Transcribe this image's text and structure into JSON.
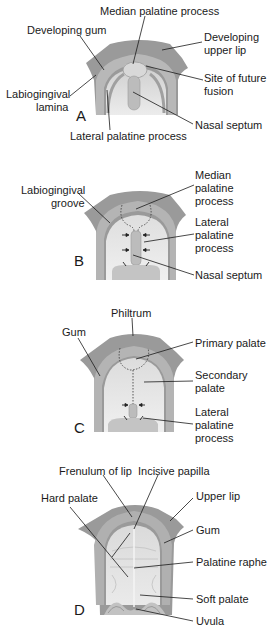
{
  "colors": {
    "tissue_dark": "#8f8f8f",
    "tissue_mid": "#ababab",
    "tissue_light": "#d6d6d6",
    "palate_light": "#e6e6e6",
    "leader_line": "#1a1a1a",
    "text": "#1a1a1a"
  },
  "panels": [
    {
      "letter": "A",
      "labels": {
        "median_palatine_process": "Median palatine process",
        "developing_gum": "Developing gum",
        "developing_upper_lip_1": "Developing",
        "developing_upper_lip_2": "upper lip",
        "site_future_fusion_1": "Site of future",
        "site_future_fusion_2": "fusion",
        "labiogingival_lamina_1": "Labiogingival",
        "labiogingival_lamina_2": "lamina",
        "nasal_septum": "Nasal septum",
        "lateral_palatine_process": "Lateral palatine process"
      }
    },
    {
      "letter": "B",
      "labels": {
        "median_palatine_process_1": "Median",
        "median_palatine_process_2": "palatine",
        "median_palatine_process_3": "process",
        "labiogingival_groove_1": "Labiogingival",
        "labiogingival_groove_2": "groove",
        "lateral_palatine_process_1": "Lateral",
        "lateral_palatine_process_2": "palatine",
        "lateral_palatine_process_3": "process",
        "nasal_septum": "Nasal septum"
      }
    },
    {
      "letter": "C",
      "labels": {
        "philtrum": "Philtrum",
        "gum": "Gum",
        "primary_palate": "Primary palate",
        "secondary_palate_1": "Secondary",
        "secondary_palate_2": "palate",
        "lateral_palatine_process_1": "Lateral",
        "lateral_palatine_process_2": "palatine",
        "lateral_palatine_process_3": "process"
      }
    },
    {
      "letter": "D",
      "labels": {
        "frenulum_of_lip": "Frenulum of lip",
        "incisive_papilla": "Incisive papilla",
        "hard_palate": "Hard palate",
        "upper_lip": "Upper lip",
        "gum": "Gum",
        "palatine_raphe": "Palatine raphe",
        "soft_palate": "Soft palate",
        "uvula": "Uvula"
      }
    }
  ]
}
